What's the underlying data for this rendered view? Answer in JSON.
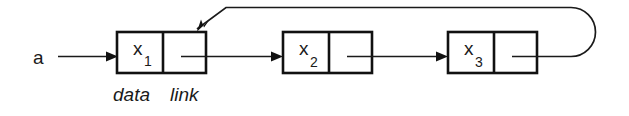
{
  "diagram": {
    "background_color": "#ffffff",
    "ink_color": "#111111",
    "head_pointer": {
      "label": "a",
      "icon": "arrow-right-icon"
    },
    "field_labels": {
      "data": "data",
      "link": "link"
    },
    "nodes": [
      {
        "id": "node-1",
        "data_base": "x",
        "data_sub": "1",
        "box": {
          "x": 117,
          "y": 32,
          "w": 89,
          "h": 41,
          "divider_x": 163
        }
      },
      {
        "id": "node-2",
        "data_base": "x",
        "data_sub": "2",
        "box": {
          "x": 283,
          "y": 32,
          "w": 89,
          "h": 41,
          "divider_x": 329
        }
      },
      {
        "id": "node-3",
        "data_base": "x",
        "data_sub": "3",
        "box": {
          "x": 448,
          "y": 32,
          "w": 89,
          "h": 41,
          "divider_x": 494
        }
      }
    ],
    "edges": [
      {
        "id": "edge-head-to-node-1",
        "from": "a",
        "to": "node-1",
        "kind": "straight"
      },
      {
        "id": "edge-node-1-to-node-2",
        "from": "node-1",
        "to": "node-2",
        "kind": "straight"
      },
      {
        "id": "edge-node-2-to-node-3",
        "from": "node-2",
        "to": "node-3",
        "kind": "straight"
      },
      {
        "id": "edge-node-3-to-node-1",
        "from": "node-3",
        "to": "node-1",
        "kind": "loop-back"
      }
    ]
  }
}
